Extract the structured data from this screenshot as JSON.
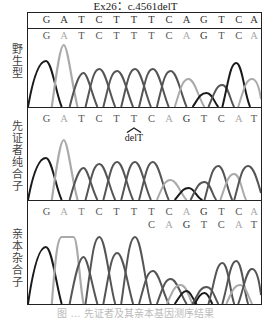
{
  "figure": {
    "title": "Ex26：c.4561delT",
    "caption": "图 … 先证者及其亲本基因测序结果",
    "colors": {
      "dark_base": "#1a1a1a",
      "mid_base": "#555555",
      "light_base": "#aaaaaa",
      "frame": "#222222"
    },
    "panels": [
      {
        "label": "野生型",
        "reference_sequence": [
          "G",
          "A",
          "T",
          "C",
          "T",
          "T",
          "T",
          "C",
          "A",
          "G",
          "T",
          "C",
          "A"
        ],
        "called_sequence": [
          "G",
          "A",
          "T",
          "C",
          "T",
          "T",
          "T",
          "C",
          "A",
          "G",
          "T",
          "C",
          "A"
        ],
        "annotation": ""
      },
      {
        "label": "先证者纯合子",
        "called_sequence": [
          "G",
          "A",
          "T",
          "C",
          "T",
          "T",
          "C",
          "A",
          "G",
          "T",
          "C",
          "A",
          "T"
        ],
        "annotation": "delT"
      },
      {
        "label": "亲本杂合子",
        "called_sequence": [
          "G",
          "A",
          "T",
          "C",
          "T",
          "T",
          "T",
          "C",
          "A",
          "G",
          "T",
          "C",
          "A"
        ],
        "secondary_sequence": [
          "C",
          "A",
          "G",
          "T",
          "C",
          "A",
          "T"
        ],
        "annotation": ""
      }
    ]
  }
}
